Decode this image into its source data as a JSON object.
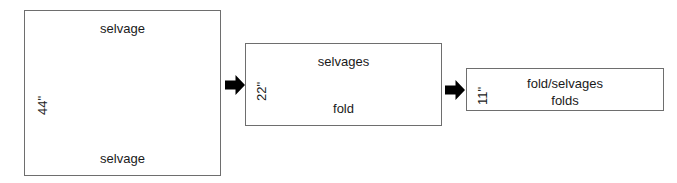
{
  "diagram": {
    "stroke_color": "#6e6e6e",
    "text_color": "#1a1a1a",
    "arrow_color": "#000000",
    "background_color": "#ffffff",
    "panels": [
      {
        "id": "panel-44",
        "width_label": "44\"",
        "top_label": "selvage",
        "bottom_label": "selvage"
      },
      {
        "id": "panel-22",
        "width_label": "22\"",
        "top_label": "selvages",
        "bottom_label": "fold"
      },
      {
        "id": "panel-11",
        "width_label": "11\"",
        "top_label": "fold/selvages",
        "bottom_label": "folds"
      }
    ],
    "arrows": [
      {
        "id": "arrow-1",
        "icon": "arrow-right-icon"
      },
      {
        "id": "arrow-2",
        "icon": "arrow-right-icon"
      }
    ]
  }
}
